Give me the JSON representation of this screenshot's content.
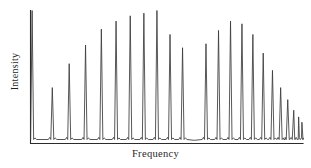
{
  "chart_data": {
    "type": "line",
    "title": "",
    "subtitle": "",
    "xlabel": "Frequency",
    "ylabel": "Intensity",
    "grid": false,
    "legend": null,
    "annotations": [],
    "axis_style": "two-axis-corner",
    "xlim": [
      0,
      100
    ],
    "ylim": [
      0,
      100
    ],
    "x_tick_labels": [],
    "y_tick_labels": [],
    "baseline": 3,
    "peak_half_width": 0.55,
    "series": [
      {
        "name": "Spectrum",
        "color": "#3a3a3a",
        "x": [
          0.6,
          8.0,
          14.2,
          20.2,
          26.0,
          31.4,
          36.6,
          41.6,
          46.4,
          51.2,
          55.8,
          64.4,
          69.0,
          73.4,
          77.6,
          81.6,
          85.4,
          88.8,
          91.8,
          94.4,
          96.6,
          98.4,
          99.6
        ],
        "values": [
          100,
          42,
          60,
          74,
          86,
          92,
          96,
          98,
          100,
          82,
          72,
          75,
          85,
          92,
          90,
          82,
          68,
          55,
          42,
          33,
          25,
          20,
          16
        ]
      }
    ],
    "peak_count": 23,
    "gap": {
      "from": 55.8,
      "to": 64.4,
      "note": "missing central line (band origin / Q-branch gap)"
    }
  },
  "figure": {
    "background": "#ffffff",
    "axis_color": "#2b2b2b",
    "trace_color": "#3a3a3a"
  }
}
